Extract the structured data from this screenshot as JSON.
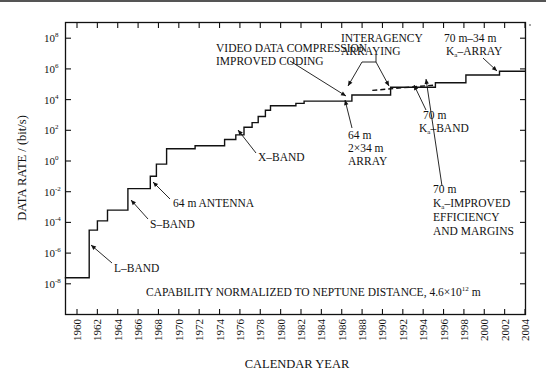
{
  "chart_data": {
    "type": "line",
    "subtype": "step",
    "title": "",
    "xlabel": "CALENDAR YEAR",
    "ylabel": "DATA RATE / (bit/s)",
    "yscale": "log",
    "xlim": [
      1959,
      2004
    ],
    "ylim_exponent": [
      -10,
      9.5
    ],
    "x_ticks": [
      1960,
      1962,
      1964,
      1966,
      1968,
      1970,
      1972,
      1974,
      1976,
      1978,
      1980,
      1982,
      1984,
      1986,
      1988,
      1990,
      1992,
      1994,
      1996,
      1998,
      2000,
      2002,
      2004
    ],
    "y_ticks": [
      {
        "exp": 8,
        "label": "10",
        "sup": "8"
      },
      {
        "exp": 6,
        "label": "10",
        "sup": "6"
      },
      {
        "exp": 4,
        "label": "10",
        "sup": "4"
      },
      {
        "exp": 2,
        "label": "10",
        "sup": "2"
      },
      {
        "exp": 0,
        "label": "10",
        "sup": "0"
      },
      {
        "exp": -2,
        "label": "10",
        "sup": "-2"
      },
      {
        "exp": -4,
        "label": "10",
        "sup": "-4"
      },
      {
        "exp": -6,
        "label": "10",
        "sup": "-6"
      },
      {
        "exp": -8,
        "label": "10",
        "sup": "-8"
      }
    ],
    "series": [
      {
        "name": "Capability (solid)",
        "style": "solid",
        "points_year_log10rate": [
          [
            1958.8,
            -7.6
          ],
          [
            1961.2,
            -7.6
          ],
          [
            1961.2,
            -4.5
          ],
          [
            1962.0,
            -4.5
          ],
          [
            1962.0,
            -3.9
          ],
          [
            1963.0,
            -3.9
          ],
          [
            1963.0,
            -3.2
          ],
          [
            1965.0,
            -3.2
          ],
          [
            1965.0,
            -1.8
          ],
          [
            1967.2,
            -1.8
          ],
          [
            1967.2,
            -1.0
          ],
          [
            1967.8,
            -1.0
          ],
          [
            1967.8,
            -0.2
          ],
          [
            1968.8,
            -0.2
          ],
          [
            1968.8,
            0.8
          ],
          [
            1971.6,
            0.8
          ],
          [
            1971.6,
            1.0
          ],
          [
            1974.5,
            1.0
          ],
          [
            1974.5,
            1.4
          ],
          [
            1975.6,
            1.4
          ],
          [
            1975.6,
            1.7
          ],
          [
            1976.4,
            1.7
          ],
          [
            1976.4,
            2.2
          ],
          [
            1977.2,
            2.2
          ],
          [
            1977.2,
            2.5
          ],
          [
            1977.8,
            2.5
          ],
          [
            1977.8,
            2.9
          ],
          [
            1978.5,
            2.9
          ],
          [
            1978.5,
            3.3
          ],
          [
            1979.0,
            3.3
          ],
          [
            1979.0,
            3.6
          ],
          [
            1981.5,
            3.6
          ],
          [
            1981.5,
            3.75
          ],
          [
            1982.3,
            3.75
          ],
          [
            1982.3,
            3.9
          ],
          [
            1987.0,
            3.9
          ],
          [
            1987.0,
            4.3
          ],
          [
            1990.8,
            4.3
          ],
          [
            1990.8,
            4.8
          ],
          [
            1995.2,
            4.8
          ],
          [
            1995.2,
            5.1
          ],
          [
            1998.2,
            5.1
          ],
          [
            1998.2,
            5.6
          ],
          [
            2001.5,
            5.6
          ],
          [
            2001.5,
            5.85
          ],
          [
            2004.0,
            5.85
          ]
        ]
      },
      {
        "name": "Interagency arraying (dashed)",
        "style": "dashed",
        "points_year_log10rate": [
          [
            1989.0,
            4.6
          ],
          [
            1995.2,
            4.95
          ]
        ]
      }
    ],
    "annotations": [
      {
        "text": [
          "L–BAND"
        ],
        "x": 1962.5,
        "y_exp": -7.0
      },
      {
        "text": [
          "S–BAND"
        ],
        "x": 1964.5,
        "y_exp": -4.2
      },
      {
        "text": [
          "64 m ANTENNA"
        ],
        "x": 1966.3,
        "y_exp": -2.7
      },
      {
        "text": [
          "X–BAND"
        ],
        "x": 1976.5,
        "y_exp": 1.1
      },
      {
        "text": [
          "VIDEO DATA COMPRESSION",
          "IMPROVED CODING"
        ],
        "x": 1976,
        "y_exp": 5.5
      },
      {
        "text": [
          "INTERAGENCY",
          "ARRAYING"
        ],
        "x": 1989.3,
        "y_exp": 7.0
      },
      {
        "text": [
          "70 m–34 m",
          "Kₐ–ARRAY"
        ],
        "x": 1998.2,
        "y_exp": 7.5
      },
      {
        "text": [
          "64 m",
          "2×34 m",
          "ARRAY"
        ],
        "x": 1986.6,
        "y_exp": 2.7
      },
      {
        "text": [
          "70 m",
          "Kₐ–BAND"
        ],
        "x": 1994.5,
        "y_exp": 3.0
      },
      {
        "text": [
          "70 m",
          "Kₐ–IMPROVED",
          "EFFICIENCY",
          "AND MARGINS"
        ],
        "x": 1996.7,
        "y_exp": -1.6
      },
      {
        "text": [
          "CAPABILITY NORMALIZED TO NEPTUNE DISTANCE, 4.6×10¹²  m"
        ],
        "x": 1969.5,
        "y_exp": -8.9
      }
    ]
  },
  "labels": {
    "xlabel": "CALENDAR YEAR",
    "ylabel": "DATA RATE / (bit/s)",
    "l_band": "L–BAND",
    "s_band": "S–BAND",
    "antenna_64m": "64 m ANTENNA",
    "x_band": "X–BAND",
    "video_1": "VIDEO DATA COMPRESSION",
    "video_2": "IMPROVED CODING",
    "interagency_1": "INTERAGENCY",
    "interagency_2": "ARRAYING",
    "ka_array_1": "70 m–34 m",
    "ka_array_2_K": "K",
    "ka_array_2_sub": "a",
    "ka_array_2_rest": "–ARRAY",
    "array64_1": "64 m",
    "array64_2": "2×34 m",
    "array64_3": "ARRAY",
    "ka_band_1": "70 m",
    "ka_band_2_K": "K",
    "ka_band_2_sub": "a",
    "ka_band_2_rest": "–BAND",
    "improved_1": "70 m",
    "improved_2_K": "K",
    "improved_2_sub": "a",
    "improved_2_rest": "–IMPROVED",
    "improved_3": "EFFICIENCY",
    "improved_4": "AND MARGINS",
    "capability_main": "CAPABILITY NORMALIZED TO NEPTUNE DISTANCE, 4.6×10",
    "capability_sup": "12",
    "capability_unit": " m"
  }
}
